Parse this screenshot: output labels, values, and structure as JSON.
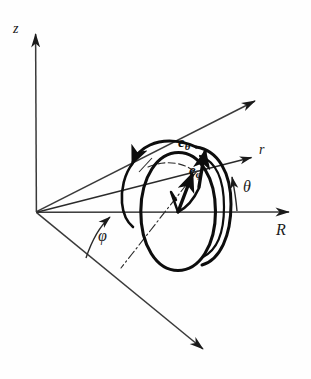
{
  "figure": {
    "background_color": "#fefefe",
    "stroke_color": "#1a1a1a",
    "accent_color": "#000000"
  },
  "axes": [
    {
      "id": "z",
      "label": "z",
      "direction": "up",
      "description": "vertical polar axis"
    },
    {
      "id": "R",
      "label": "R",
      "direction": "right",
      "description": "horizontal cylindrical radial axis"
    },
    {
      "id": "r",
      "label": "r",
      "direction": "up-right",
      "description": "spherical radial direction"
    },
    {
      "id": "upper-diagonal",
      "label": "",
      "direction": "up-right-far",
      "description": "in-plane axis drawn in perspective"
    },
    {
      "id": "lower-diagonal",
      "label": "",
      "direction": "down-right",
      "description": "in-plane axis drawn in perspective"
    }
  ],
  "angles": [
    {
      "id": "theta",
      "label": "θ",
      "description": "polar angle measured from R axis up to r direction"
    },
    {
      "id": "phi",
      "label": "φ",
      "description": "azimuthal angle measured in the horizontal plane"
    }
  ],
  "unit_vectors": [
    {
      "id": "e-theta",
      "base": "e",
      "subscript": "θ",
      "description": "unit vector in the direction of increasing theta"
    },
    {
      "id": "e-phi",
      "base": "e",
      "subscript": "φ",
      "description": "unit vector in the direction of increasing phi"
    }
  ],
  "shapes": [
    {
      "id": "sphere-outline",
      "type": "ellipse",
      "description": "hand drawn circle representing the sphere cross-section"
    },
    {
      "id": "rotation-band",
      "type": "arc-band",
      "description": "thick curved band wrapping the sphere with arrowheads"
    },
    {
      "id": "hidden-dashdot",
      "type": "dash-dot-line",
      "description": "hidden construction line through the sphere"
    }
  ]
}
